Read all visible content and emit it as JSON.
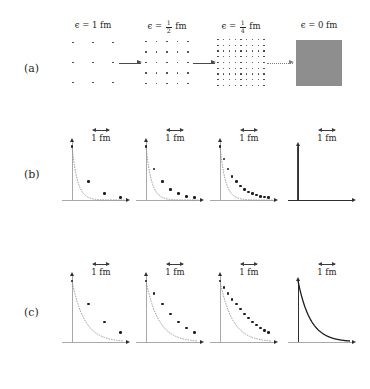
{
  "figure": {
    "kind": "continuum-limit-illustration",
    "rows": [
      {
        "id": "a",
        "label": "(a)"
      },
      {
        "id": "b",
        "label": "(b)"
      },
      {
        "id": "c",
        "label": "(c)"
      }
    ]
  },
  "panel_a": {
    "columns": [
      {
        "eps_label": "ϵ = 1 fm",
        "eps_value": "1",
        "eps_kind": "integer",
        "grid": 3,
        "dot_size": 1.5
      },
      {
        "eps_label": "ϵ = ½ fm",
        "eps_num": "1",
        "eps_den": "2",
        "eps_kind": "fraction",
        "grid": 5,
        "dot_size": 1.3
      },
      {
        "eps_label": "ϵ = ¼ fm",
        "eps_num": "1",
        "eps_den": "4",
        "eps_kind": "fraction",
        "grid": 9,
        "dot_size": 1.1
      },
      {
        "eps_label": "ϵ = 0 fm",
        "eps_value": "0",
        "eps_kind": "integer",
        "grid": 0,
        "dot_size": 0
      }
    ],
    "eps_symbol": "ϵ",
    "equals": "=",
    "unit": "fm",
    "arrows": [
      {
        "style": "solid"
      },
      {
        "style": "solid"
      },
      {
        "style": "dotted"
      }
    ],
    "continuum_block_color": "#8e8e8e"
  },
  "scalebar": {
    "label": "1 fm"
  },
  "chart_data": [
    {
      "type": "scatter",
      "row": "b",
      "panel": 1,
      "title": "",
      "xlabel": "",
      "ylabel": "",
      "grid": false,
      "legend": null,
      "curve": "exponential-decay",
      "decay_rate": 3.0,
      "spacing_fm": 1,
      "xlim": [
        0,
        3.2
      ],
      "ylim": [
        0,
        1.08
      ],
      "x": [
        0,
        1,
        2,
        3
      ],
      "y": [
        1.0,
        0.34,
        0.12,
        0.042
      ]
    },
    {
      "type": "scatter",
      "row": "b",
      "panel": 2,
      "curve": "exponential-decay",
      "decay_rate": 3.0,
      "spacing_fm": 0.5,
      "xlim": [
        0,
        3.2
      ],
      "ylim": [
        0,
        1.08
      ],
      "x": [
        0,
        0.5,
        1.0,
        1.5,
        2.0,
        2.5,
        3.0
      ],
      "y": [
        1.0,
        0.58,
        0.34,
        0.2,
        0.12,
        0.07,
        0.042
      ]
    },
    {
      "type": "scatter",
      "row": "b",
      "panel": 3,
      "curve": "exponential-decay",
      "decay_rate": 3.0,
      "spacing_fm": 0.25,
      "xlim": [
        0,
        3.2
      ],
      "ylim": [
        0,
        1.08
      ],
      "x": [
        0,
        0.25,
        0.5,
        0.75,
        1.0,
        1.25,
        1.5,
        1.75,
        2.0,
        2.25,
        2.5,
        2.75,
        3.0
      ],
      "y": [
        1.0,
        0.76,
        0.58,
        0.44,
        0.34,
        0.26,
        0.2,
        0.15,
        0.12,
        0.09,
        0.07,
        0.053,
        0.042
      ]
    },
    {
      "type": "line",
      "row": "b",
      "panel": 4,
      "curve": "delta-function",
      "spacing_fm": 0,
      "xlim": [
        0,
        3.2
      ],
      "ylim": [
        0,
        1.08
      ],
      "x": [
        0,
        0
      ],
      "y": [
        0,
        1.0
      ]
    },
    {
      "type": "scatter",
      "row": "c",
      "panel": 1,
      "curve": "exponential-decay",
      "decay_rate": 1.3,
      "spacing_fm": 1,
      "xlim": [
        0,
        3.2
      ],
      "ylim": [
        0,
        1.08
      ],
      "x": [
        0,
        1,
        2,
        3
      ],
      "y": [
        1.0,
        0.62,
        0.33,
        0.16
      ]
    },
    {
      "type": "scatter",
      "row": "c",
      "panel": 2,
      "curve": "exponential-decay",
      "decay_rate": 1.3,
      "spacing_fm": 0.5,
      "xlim": [
        0,
        3.2
      ],
      "ylim": [
        0,
        1.08
      ],
      "x": [
        0,
        0.5,
        1.0,
        1.5,
        2.0,
        2.5,
        3.0
      ],
      "y": [
        1.0,
        0.79,
        0.62,
        0.46,
        0.33,
        0.23,
        0.16
      ]
    },
    {
      "type": "scatter",
      "row": "c",
      "panel": 3,
      "curve": "exponential-decay",
      "decay_rate": 1.3,
      "spacing_fm": 0.25,
      "xlim": [
        0,
        3.2
      ],
      "ylim": [
        0,
        1.08
      ],
      "x": [
        0,
        0.25,
        0.5,
        0.75,
        1.0,
        1.25,
        1.5,
        1.75,
        2.0,
        2.25,
        2.5,
        2.75,
        3.0
      ],
      "y": [
        1.0,
        0.89,
        0.79,
        0.7,
        0.62,
        0.54,
        0.46,
        0.39,
        0.33,
        0.28,
        0.23,
        0.19,
        0.16
      ]
    },
    {
      "type": "line",
      "row": "c",
      "panel": 4,
      "curve": "exponential-decay-continuous",
      "decay_rate": 1.3,
      "spacing_fm": 0,
      "xlim": [
        0,
        3.2
      ],
      "ylim": [
        0,
        1.08
      ]
    }
  ]
}
